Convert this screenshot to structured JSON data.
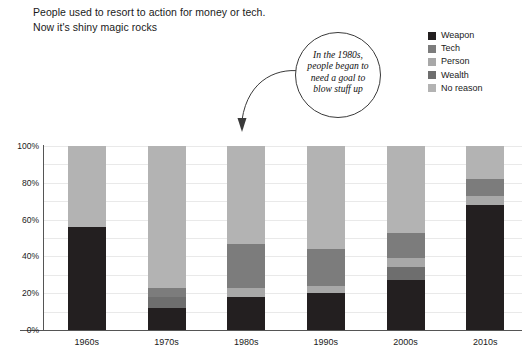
{
  "headline": {
    "line1": "People used to resort to action for money or tech.",
    "line2": "Now it's shiny magic rocks"
  },
  "callout": {
    "text": "In the 1980s, people began to need a goal to blow stuff up",
    "arrow_name": "curved-arrow"
  },
  "legend": {
    "position": "top-right",
    "items": [
      {
        "label": "Weapon",
        "color": "#231f20"
      },
      {
        "label": "Tech",
        "color": "#7c7c7c"
      },
      {
        "label": "Person",
        "color": "#a8a8a8"
      },
      {
        "label": "Wealth",
        "color": "#6e6e6e"
      },
      {
        "label": "No reason",
        "color": "#b3b3b3"
      }
    ]
  },
  "chart_data": {
    "type": "bar",
    "stacked": true,
    "normalized": true,
    "title": "People used to resort to action for money or tech. Now it's shiny magic rocks",
    "xlabel": "",
    "ylabel": "",
    "ylim": [
      0,
      100
    ],
    "yticks": [
      "0%",
      "20%",
      "40%",
      "60%",
      "80%",
      "100%"
    ],
    "ytick_values": [
      0,
      20,
      40,
      60,
      80,
      100
    ],
    "grid": true,
    "categories": [
      "1960s",
      "1970s",
      "1980s",
      "1990s",
      "2000s",
      "2010s"
    ],
    "series": [
      {
        "name": "Weapon",
        "color": "#231f20",
        "values": [
          56,
          12,
          18,
          20,
          27,
          68
        ]
      },
      {
        "name": "Wealth",
        "color": "#6e6e6e",
        "values": [
          0,
          6,
          0,
          0,
          7,
          0
        ]
      },
      {
        "name": "Person",
        "color": "#a8a8a8",
        "values": [
          0,
          0,
          5,
          4,
          5,
          5
        ]
      },
      {
        "name": "Tech",
        "color": "#7c7c7c",
        "values": [
          0,
          5,
          24,
          20,
          14,
          9
        ]
      },
      {
        "name": "No reason",
        "color": "#b3b3b3",
        "values": [
          44,
          77,
          53,
          56,
          47,
          18
        ]
      }
    ]
  }
}
